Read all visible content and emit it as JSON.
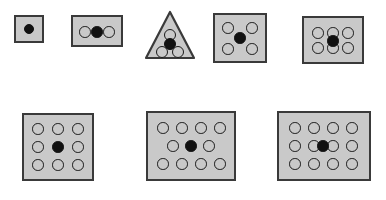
{
  "figure": {
    "background_color": "#ffffff",
    "shape_fill_color": "#c9c9c9",
    "shape_border_color": "#3a3a3a",
    "open_circle_fill": "#c9c9c9",
    "open_circle_stroke": "#1a1a1a",
    "filled_dot_color": "#111111",
    "width": 386,
    "height": 200,
    "row_count": 2
  },
  "chart_data": {
    "type": "scatter",
    "xlabel": "",
    "ylabel": "",
    "shapes": [
      {
        "id": "shape-1",
        "row": 1,
        "index": 1,
        "container": "square",
        "label": "1 filled dot",
        "open_circle_count": 0,
        "filled_circle_count": 1,
        "total_markers": 1,
        "box": {
          "x": 14,
          "y": 15,
          "w": 30,
          "h": 28
        },
        "circle_radius": 5.2,
        "markers": [
          {
            "type": "filled",
            "cx": 15,
            "cy": 14
          }
        ]
      },
      {
        "id": "shape-2",
        "row": 1,
        "index": 2,
        "container": "rectangle",
        "label": "3 in a row",
        "open_circle_count": 2,
        "filled_circle_count": 1,
        "total_markers": 3,
        "box": {
          "x": 71,
          "y": 15,
          "w": 52,
          "h": 32
        },
        "circle_radius": 5.8,
        "markers": [
          {
            "type": "open",
            "cx": 14,
            "cy": 17
          },
          {
            "type": "filled",
            "cx": 26,
            "cy": 17
          },
          {
            "type": "open",
            "cx": 38,
            "cy": 17
          }
        ]
      },
      {
        "id": "shape-3",
        "row": 1,
        "index": 3,
        "container": "triangle",
        "label": "triangle with 4",
        "open_circle_count": 3,
        "filled_circle_count": 1,
        "total_markers": 4,
        "box": {
          "x": 144,
          "y": 10,
          "w": 52,
          "h": 50
        },
        "circle_radius": 6.0,
        "markers": [
          {
            "type": "open",
            "cx": 26,
            "cy": 25
          },
          {
            "type": "filled",
            "cx": 26,
            "cy": 34
          },
          {
            "type": "open",
            "cx": 18,
            "cy": 42
          },
          {
            "type": "open",
            "cx": 34,
            "cy": 42
          }
        ]
      },
      {
        "id": "shape-4",
        "row": 1,
        "index": 4,
        "container": "square",
        "label": "4 corners plus center",
        "open_circle_count": 4,
        "filled_circle_count": 1,
        "total_markers": 5,
        "box": {
          "x": 213,
          "y": 13,
          "w": 54,
          "h": 50
        },
        "circle_radius": 5.8,
        "markers": [
          {
            "type": "open",
            "cx": 15,
            "cy": 15
          },
          {
            "type": "open",
            "cx": 39,
            "cy": 15
          },
          {
            "type": "filled",
            "cx": 27,
            "cy": 25
          },
          {
            "type": "open",
            "cx": 15,
            "cy": 36
          },
          {
            "type": "open",
            "cx": 39,
            "cy": 36
          }
        ]
      },
      {
        "id": "shape-5",
        "row": 1,
        "index": 5,
        "container": "rectangle",
        "label": "2 by 3 grid",
        "open_circle_count": 6,
        "filled_circle_count": 1,
        "total_markers": 7,
        "box": {
          "x": 302,
          "y": 16,
          "w": 62,
          "h": 48
        },
        "circle_radius": 5.8,
        "markers": [
          {
            "type": "open",
            "cx": 16,
            "cy": 17
          },
          {
            "type": "open",
            "cx": 31,
            "cy": 17
          },
          {
            "type": "open",
            "cx": 46,
            "cy": 17
          },
          {
            "type": "open",
            "cx": 16,
            "cy": 32
          },
          {
            "type": "open",
            "cx": 31,
            "cy": 32
          },
          {
            "type": "open",
            "cx": 46,
            "cy": 32
          },
          {
            "type": "filled",
            "cx": 31,
            "cy": 25
          }
        ]
      },
      {
        "id": "shape-6",
        "row": 2,
        "index": 6,
        "container": "square",
        "label": "3 by 3 grid",
        "open_circle_count": 8,
        "filled_circle_count": 1,
        "total_markers": 9,
        "box": {
          "x": 22,
          "y": 113,
          "w": 72,
          "h": 68
        },
        "circle_radius": 5.8,
        "markers": [
          {
            "type": "open",
            "cx": 16,
            "cy": 16
          },
          {
            "type": "open",
            "cx": 36,
            "cy": 16
          },
          {
            "type": "open",
            "cx": 56,
            "cy": 16
          },
          {
            "type": "open",
            "cx": 16,
            "cy": 34
          },
          {
            "type": "filled",
            "cx": 36,
            "cy": 34
          },
          {
            "type": "open",
            "cx": 56,
            "cy": 34
          },
          {
            "type": "open",
            "cx": 16,
            "cy": 52
          },
          {
            "type": "open",
            "cx": 36,
            "cy": 52
          },
          {
            "type": "open",
            "cx": 56,
            "cy": 52
          }
        ]
      },
      {
        "id": "shape-7",
        "row": 2,
        "index": 7,
        "container": "rectangle",
        "label": "4 4 rows with 3 middle",
        "open_circle_count": 10,
        "filled_circle_count": 1,
        "total_markers": 11,
        "box": {
          "x": 146,
          "y": 111,
          "w": 90,
          "h": 70
        },
        "circle_radius": 5.8,
        "markers": [
          {
            "type": "open",
            "cx": 17,
            "cy": 17
          },
          {
            "type": "open",
            "cx": 36,
            "cy": 17
          },
          {
            "type": "open",
            "cx": 55,
            "cy": 17
          },
          {
            "type": "open",
            "cx": 74,
            "cy": 17
          },
          {
            "type": "open",
            "cx": 27,
            "cy": 35
          },
          {
            "type": "filled",
            "cx": 45,
            "cy": 35
          },
          {
            "type": "open",
            "cx": 63,
            "cy": 35
          },
          {
            "type": "open",
            "cx": 17,
            "cy": 53
          },
          {
            "type": "open",
            "cx": 36,
            "cy": 53
          },
          {
            "type": "open",
            "cx": 55,
            "cy": 53
          },
          {
            "type": "open",
            "cx": 74,
            "cy": 53
          }
        ]
      },
      {
        "id": "shape-8",
        "row": 2,
        "index": 8,
        "container": "rectangle",
        "label": "3 by 4 grid",
        "open_circle_count": 12,
        "filled_circle_count": 1,
        "total_markers": 13,
        "box": {
          "x": 277,
          "y": 111,
          "w": 94,
          "h": 70
        },
        "circle_radius": 5.8,
        "markers": [
          {
            "type": "open",
            "cx": 18,
            "cy": 17
          },
          {
            "type": "open",
            "cx": 37,
            "cy": 17
          },
          {
            "type": "open",
            "cx": 56,
            "cy": 17
          },
          {
            "type": "open",
            "cx": 75,
            "cy": 17
          },
          {
            "type": "open",
            "cx": 18,
            "cy": 35
          },
          {
            "type": "open",
            "cx": 37,
            "cy": 35
          },
          {
            "type": "open",
            "cx": 56,
            "cy": 35
          },
          {
            "type": "open",
            "cx": 75,
            "cy": 35
          },
          {
            "type": "filled",
            "cx": 46,
            "cy": 35
          },
          {
            "type": "open",
            "cx": 18,
            "cy": 53
          },
          {
            "type": "open",
            "cx": 37,
            "cy": 53
          },
          {
            "type": "open",
            "cx": 56,
            "cy": 53
          },
          {
            "type": "open",
            "cx": 75,
            "cy": 53
          }
        ]
      }
    ]
  }
}
